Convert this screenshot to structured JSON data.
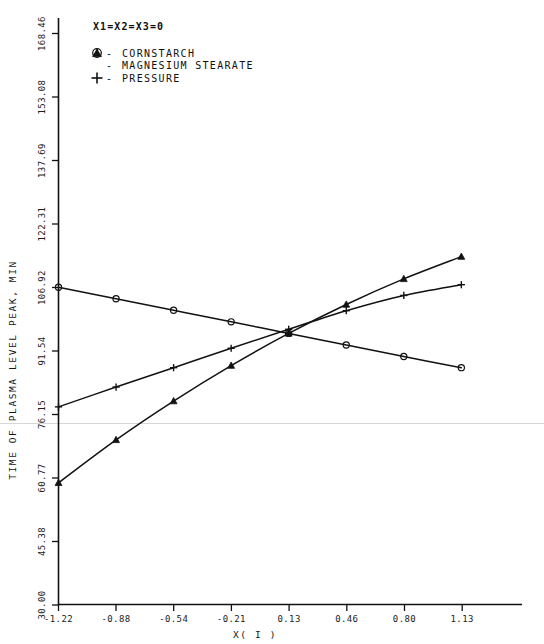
{
  "chart_data": {
    "type": "line",
    "title": "",
    "annotation": "X1=X2=X3=0",
    "xlabel": "X( I )",
    "ylabel": "TIME OF PLASMA LEVEL PEAK, MIN",
    "grid": false,
    "legend_position": "top-left",
    "xlim": [
      -1.22,
      1.255
    ],
    "ylim": [
      30.0,
      176.15
    ],
    "xticks": [
      "-1.22",
      "-0.88",
      "-0.54",
      "-0.21",
      "0.13",
      "0.46",
      "0.80",
      "1.13"
    ],
    "xtick_values": [
      -1.22,
      -0.88,
      -0.54,
      -0.21,
      0.13,
      0.46,
      0.8,
      1.13
    ],
    "yticks": [
      "30.00",
      "45.38",
      "60.77",
      "76.15",
      "91.54",
      "106.92",
      "122.31",
      "137.69",
      "153.08",
      "168.46"
    ],
    "ytick_values": [
      30.0,
      45.38,
      60.77,
      76.15,
      91.54,
      106.92,
      122.31,
      137.69,
      153.08,
      168.46
    ],
    "x": [
      -1.22,
      -0.885,
      -0.55,
      -0.215,
      0.12,
      0.455,
      0.79,
      1.125
    ],
    "series": [
      {
        "name": "CORNSTARCH",
        "marker": "circle",
        "legend_symbol": "circle-tick",
        "values": [
          107.0,
          104.2,
          101.4,
          98.6,
          95.8,
          93.0,
          90.2,
          87.5
        ]
      },
      {
        "name": "MAGNESIUM STEARATE",
        "marker": "triangle",
        "legend_symbol": "triangle",
        "values": [
          59.6,
          70.0,
          79.4,
          88.0,
          95.8,
          102.8,
          109.0,
          114.4
        ]
      },
      {
        "name": "PRESSURE",
        "marker": "plus",
        "legend_symbol": "plus",
        "values": [
          78.0,
          82.8,
          87.5,
          92.2,
          96.8,
          101.3,
          105.0,
          107.6
        ]
      }
    ]
  },
  "legend": {
    "items": [
      {
        "symbol": "circle-tick",
        "dash": "-",
        "label": "CORNSTARCH"
      },
      {
        "symbol": "triangle",
        "dash": "-",
        "label": "MAGNESIUM STEARATE"
      },
      {
        "symbol": "plus",
        "dash": "-",
        "label": "PRESSURE"
      }
    ]
  },
  "condition_label": "X1=X2=X3=0"
}
